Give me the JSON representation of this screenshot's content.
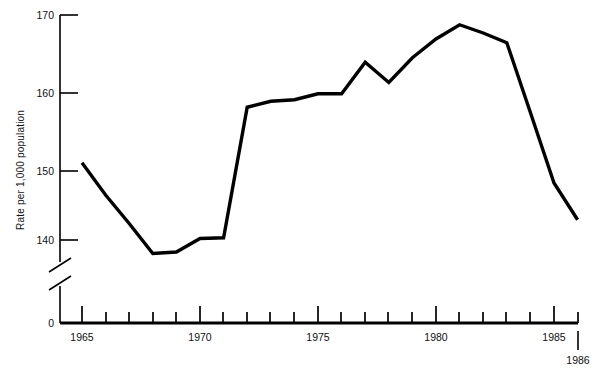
{
  "chart_data": {
    "type": "line",
    "title": "",
    "xlabel": "",
    "ylabel": "Rate per 1,000 population",
    "x": [
      1965,
      1966,
      1967,
      1968,
      1969,
      1970,
      1971,
      1972,
      1973,
      1974,
      1975,
      1976,
      1977,
      1978,
      1979,
      1980,
      1981,
      1982,
      1983,
      1984,
      1985,
      1986
    ],
    "values": [
      150.3,
      146.0,
      142.2,
      138.2,
      138.4,
      140.2,
      140.3,
      157.7,
      158.5,
      158.7,
      159.5,
      159.5,
      163.7,
      161.0,
      164.3,
      166.8,
      168.7,
      167.6,
      166.3,
      157.0,
      147.6,
      142.7
    ],
    "series": [
      {
        "name": "Rate per 1,000 population",
        "values": [
          150.3,
          146.0,
          142.2,
          138.2,
          138.4,
          140.2,
          140.3,
          157.7,
          158.5,
          158.7,
          159.5,
          159.5,
          163.7,
          161.0,
          164.3,
          166.8,
          168.7,
          167.6,
          166.3,
          157.0,
          147.6,
          142.7
        ]
      }
    ],
    "ylim": [
      137.5,
      170
    ],
    "xlim": [
      1964,
      1986
    ],
    "y_ticks": [
      140,
      150,
      160,
      170
    ],
    "y_tick_labels": [
      "140",
      "150",
      "160",
      "170"
    ],
    "y_zero_label": "0",
    "y_axis_break": true,
    "x_major_ticks": [
      1965,
      1970,
      1975,
      1980,
      1985
    ],
    "x_major_tick_labels": [
      "1965",
      "1970",
      "1975",
      "1980",
      "1985"
    ],
    "x_end_label": "1986",
    "x_minor_tick_step": 1,
    "grid": false,
    "legend": "none",
    "line_color": "#000000",
    "background_color": "#ffffff"
  },
  "axes": {
    "y_axis_title": "Rate per 1,000 population",
    "zero_label": "0",
    "end_year_label": "1986"
  }
}
